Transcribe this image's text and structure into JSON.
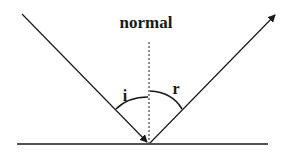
{
  "diagram": {
    "title_label": "normal",
    "incident_angle_label": "i",
    "reflected_angle_label": "r",
    "colors": {
      "line": "#1a1a1a",
      "background": "#ffffff"
    },
    "geometry": {
      "surface": {
        "x1": 17,
        "y1": 144,
        "x2": 268,
        "y2": 144
      },
      "normal": {
        "x1": 149,
        "y1": 42,
        "x2": 149,
        "y2": 143
      },
      "incident_ray": {
        "x1": 22,
        "y1": 14,
        "x2": 148,
        "y2": 143
      },
      "reflected_ray": {
        "x1": 150,
        "y1": 143,
        "x2": 276,
        "y2": 14
      }
    }
  }
}
